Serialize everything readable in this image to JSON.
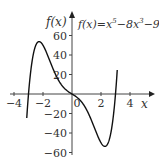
{
  "chart_data": {
    "type": "line",
    "xlabel": "x",
    "ylabel": "f(x)",
    "xlim": [
      -4.3,
      5
    ],
    "ylim": [
      -60,
      70
    ],
    "x_ticks": [
      -4,
      -2,
      0,
      2,
      4
    ],
    "y_ticks": [
      60,
      40,
      20,
      -20,
      -40,
      -60
    ],
    "x_tick_labels": [
      "−4",
      "−2",
      "0",
      "2",
      "4"
    ],
    "y_tick_labels": [
      "60",
      "40",
      "20",
      "−20",
      "−40",
      "−60"
    ],
    "grid": false,
    "legend": null,
    "series": [
      {
        "name": "f(x)=x^5-8x^3-9x",
        "function": "x^5-8x^3-9x",
        "x_range": [
          -3.12,
          3.12
        ],
        "key_points": [
          {
            "x": -3,
            "y": 0
          },
          {
            "x": -2.3,
            "y": 54
          },
          {
            "x": 0,
            "y": 0
          },
          {
            "x": 2.3,
            "y": -54
          },
          {
            "x": 3,
            "y": 0
          }
        ]
      }
    ],
    "annotations": [
      {
        "text": "f(x)=x⁵−8x³−9x",
        "position": "top-right"
      }
    ]
  },
  "labels": {
    "ylabel": "f(x)",
    "xlabel": "x",
    "equation_prefix": "f(x)=x",
    "exp5": "5",
    "mid": "−8x",
    "exp3": "3",
    "suffix": "−9x"
  }
}
